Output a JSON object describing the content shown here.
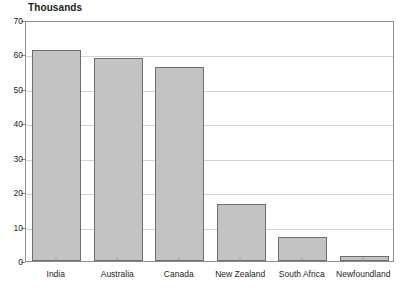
{
  "chart_data": {
    "type": "bar",
    "title": "Thousands",
    "subtitle": "",
    "xlabel": "",
    "ylabel": "",
    "categories": [
      "India",
      "Australia",
      "Canada",
      "New Zealand",
      "South Africa",
      "Newfoundland"
    ],
    "values": [
      61.3,
      59.0,
      56.3,
      16.5,
      7.0,
      1.5
    ],
    "ylim": [
      0,
      70
    ],
    "ytick_labels": [
      "0",
      "10",
      "20",
      "30",
      "40",
      "50",
      "60",
      "70"
    ],
    "ytick_values": [
      0,
      10,
      20,
      30,
      40,
      50,
      60,
      70
    ],
    "grid": true,
    "legend": false,
    "legend_position": "none",
    "bar_fill_color": "#c3c3c3",
    "bar_border_color": "#6d6d6d",
    "gridline_color": "#d2d2d2",
    "axis_color": "#8d8d8d",
    "text_color": "#231f20",
    "background_color": "#ffffff"
  }
}
